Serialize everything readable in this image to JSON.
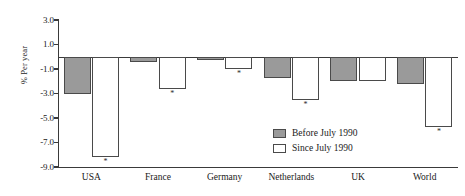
{
  "chart_data": {
    "type": "bar",
    "title": "",
    "xlabel": "",
    "ylabel": "% Per year",
    "ylim": [
      -9.0,
      3.0
    ],
    "yticks": [
      "3.0",
      "1.0",
      "-1.0",
      "-3.0",
      "-5.0",
      "-7.0",
      "-9.0"
    ],
    "ytick_values": [
      3.0,
      1.0,
      -1.0,
      -3.0,
      -5.0,
      -7.0,
      -9.0
    ],
    "grid": false,
    "legend_position": "inside-lower-right",
    "categories": [
      "USA",
      "France",
      "Germany",
      "Netherlands",
      "UK",
      "World"
    ],
    "series": [
      {
        "name": "Before July 1990",
        "color": "#9a9a9a",
        "values": [
          -3.0,
          -0.4,
          -0.3,
          -1.7,
          -2.0,
          -2.2
        ]
      },
      {
        "name": "Since July 1990",
        "color": "#ffffff",
        "values": [
          -8.2,
          -2.6,
          -1.0,
          -3.5,
          -2.0,
          -5.7
        ]
      }
    ],
    "annotations": {
      "marker": "*",
      "marked_categories": [
        "USA",
        "France",
        "Germany",
        "Netherlands",
        "World"
      ]
    }
  },
  "axis": {
    "y_label": "% Per year",
    "ticks": [
      {
        "label": "3.0"
      },
      {
        "label": "1.0"
      },
      {
        "label": "-1.0"
      },
      {
        "label": "-3.0"
      },
      {
        "label": "-5.0"
      },
      {
        "label": "-7.0"
      },
      {
        "label": "-9.0"
      }
    ]
  },
  "categories": [
    {
      "label": "USA"
    },
    {
      "label": "France"
    },
    {
      "label": "Germany"
    },
    {
      "label": "Netherlands"
    },
    {
      "label": "UK"
    },
    {
      "label": "World"
    }
  ],
  "legend": {
    "items": [
      {
        "label": "Before July 1990"
      },
      {
        "label": "Since July 1990"
      }
    ]
  },
  "marker": {
    "symbol": "*"
  }
}
